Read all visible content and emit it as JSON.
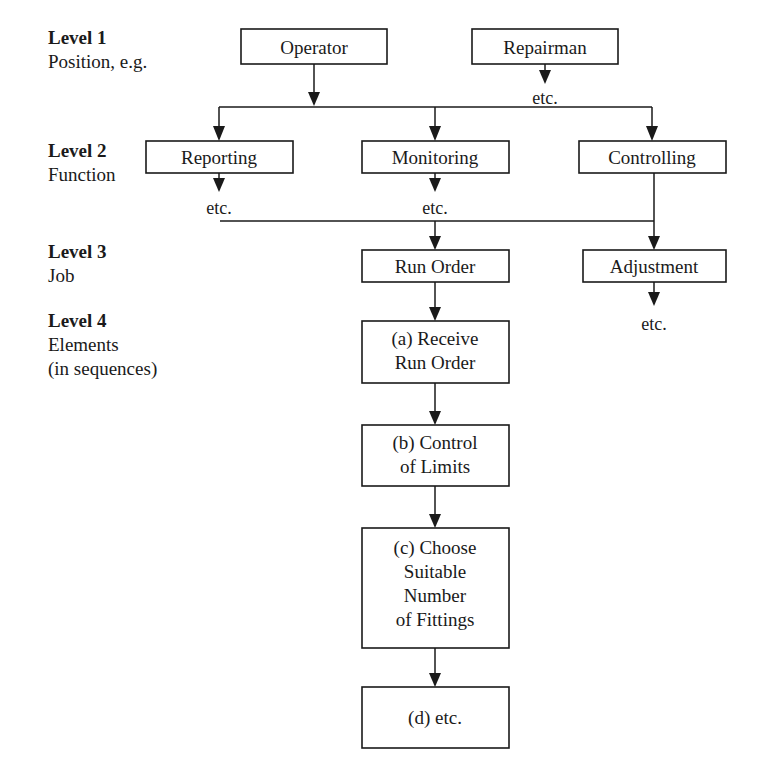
{
  "diagram": {
    "colors": {
      "line": "#1a1a1a",
      "box_fill": "#ffffff",
      "text": "#1a1a1a",
      "background": "#ffffff"
    },
    "levels": [
      {
        "id": "level-1",
        "title": "Level 1",
        "subtitle": "Position, e.g.",
        "extra": ""
      },
      {
        "id": "level-2",
        "title": "Level 2",
        "subtitle": "Function",
        "extra": ""
      },
      {
        "id": "level-3",
        "title": "Level 3",
        "subtitle": "Job",
        "extra": ""
      },
      {
        "id": "level-4",
        "title": "Level 4",
        "subtitle": "Elements",
        "extra": "(in sequences)"
      }
    ],
    "boxes": [
      {
        "id": "operator",
        "label": "Operator",
        "lines": [
          "Operator"
        ]
      },
      {
        "id": "repairman",
        "label": "Repairman",
        "lines": [
          "Repairman"
        ]
      },
      {
        "id": "reporting",
        "label": "Reporting",
        "lines": [
          "Reporting"
        ]
      },
      {
        "id": "monitoring",
        "label": "Monitoring",
        "lines": [
          "Monitoring"
        ]
      },
      {
        "id": "controlling",
        "label": "Controlling",
        "lines": [
          "Controlling"
        ]
      },
      {
        "id": "run-order",
        "label": "Run Order",
        "lines": [
          "Run Order"
        ]
      },
      {
        "id": "adjustment",
        "label": "Adjustment",
        "lines": [
          "Adjustment"
        ]
      },
      {
        "id": "element-a",
        "label": "(a) Receive Run Order",
        "lines": [
          "(a) Receive",
          "Run Order"
        ]
      },
      {
        "id": "element-b",
        "label": "(b) Control of Limits",
        "lines": [
          "(b) Control",
          "of Limits"
        ]
      },
      {
        "id": "element-c",
        "label": "(c) Choose Suitable Number of Fittings",
        "lines": [
          "(c) Choose",
          "Suitable",
          "Number",
          "of Fittings"
        ]
      },
      {
        "id": "element-d",
        "label": "(d) etc.",
        "lines": [
          "(d) etc."
        ]
      }
    ],
    "etc_labels": [
      {
        "id": "etc-repairman",
        "text": "etc."
      },
      {
        "id": "etc-reporting",
        "text": "etc."
      },
      {
        "id": "etc-monitoring",
        "text": "etc."
      },
      {
        "id": "etc-adjustment",
        "text": "etc."
      }
    ]
  }
}
